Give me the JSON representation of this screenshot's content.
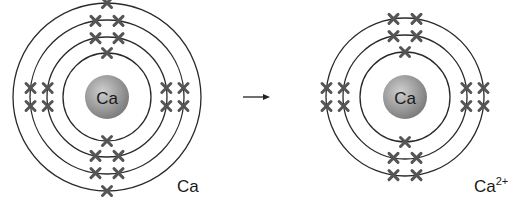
{
  "diagram": {
    "type": "electron-shell-ionization",
    "colors": {
      "ring": "#2a2a2a",
      "electron": "#555555",
      "nucleus_light": "#c8c8c8",
      "nucleus_dark": "#7a7a7a",
      "text": "#1a1a1a"
    },
    "atoms": [
      {
        "id": "calcium-atom",
        "nucleus_label": "Ca",
        "caption": "Ca",
        "caption_sup": "",
        "center": [
          107,
          97
        ],
        "nucleus_radius": 22,
        "shells": [
          {
            "radius": 44,
            "electrons": 2
          },
          {
            "radius": 60,
            "electrons": 8
          },
          {
            "radius": 77,
            "electrons": 8
          },
          {
            "radius": 94,
            "electrons": 2
          }
        ],
        "caption_pos": [
          177,
          192
        ]
      },
      {
        "id": "calcium-ion",
        "nucleus_label": "Ca",
        "caption": "Ca",
        "caption_sup": "2+",
        "center": [
          405,
          97
        ],
        "nucleus_radius": 22,
        "shells": [
          {
            "radius": 45,
            "electrons": 2
          },
          {
            "radius": 62,
            "electrons": 8
          },
          {
            "radius": 79,
            "electrons": 8
          }
        ],
        "caption_pos": [
          474,
          192
        ]
      }
    ],
    "arrow": {
      "from": [
        243,
        97
      ],
      "to": [
        270,
        97
      ],
      "label": ""
    }
  }
}
